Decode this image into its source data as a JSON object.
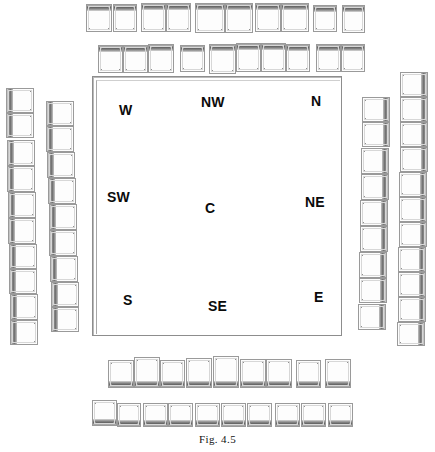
{
  "figure": {
    "caption": "Fig. 4.5",
    "plaza": {
      "name": "central-plaza",
      "labels": [
        {
          "id": "W",
          "text": "W",
          "x": 26,
          "y": 26
        },
        {
          "id": "NW",
          "text": "NW",
          "x": 108,
          "y": 18
        },
        {
          "id": "N",
          "text": "N",
          "x": 218,
          "y": 17
        },
        {
          "id": "SW",
          "text": "SW",
          "x": 14,
          "y": 113
        },
        {
          "id": "C",
          "text": "C",
          "x": 112,
          "y": 124
        },
        {
          "id": "NE",
          "text": "NE",
          "x": 212,
          "y": 118
        },
        {
          "id": "S",
          "text": "S",
          "x": 30,
          "y": 216
        },
        {
          "id": "SE",
          "text": "SE",
          "x": 115,
          "y": 222
        },
        {
          "id": "E",
          "text": "E",
          "x": 221,
          "y": 213
        }
      ]
    },
    "groups": [
      {
        "id": "top-outer-row",
        "name": "structure-row-top-outer",
        "orientation": "horizontal",
        "band": "b-top",
        "cells": [
          {
            "x": 86,
            "y": 4,
            "w": 26,
            "h": 28
          },
          {
            "x": 113,
            "y": 4,
            "w": 24,
            "h": 28
          },
          {
            "x": 141,
            "y": 3,
            "w": 25,
            "h": 29
          },
          {
            "x": 166,
            "y": 3,
            "w": 25,
            "h": 29
          },
          {
            "x": 195,
            "y": 3,
            "w": 30,
            "h": 30
          },
          {
            "x": 225,
            "y": 3,
            "w": 28,
            "h": 30
          },
          {
            "x": 255,
            "y": 3,
            "w": 26,
            "h": 29
          },
          {
            "x": 281,
            "y": 3,
            "w": 28,
            "h": 29
          },
          {
            "x": 313,
            "y": 5,
            "w": 24,
            "h": 27
          },
          {
            "x": 342,
            "y": 5,
            "w": 23,
            "h": 28
          }
        ]
      },
      {
        "id": "top-inner-row",
        "name": "structure-row-top-inner",
        "orientation": "horizontal",
        "band": "b-top",
        "cells": [
          {
            "x": 98,
            "y": 45,
            "w": 25,
            "h": 28
          },
          {
            "x": 123,
            "y": 45,
            "w": 25,
            "h": 28
          },
          {
            "x": 148,
            "y": 44,
            "w": 26,
            "h": 29
          },
          {
            "x": 180,
            "y": 45,
            "w": 25,
            "h": 27
          },
          {
            "x": 209,
            "y": 44,
            "w": 27,
            "h": 30
          },
          {
            "x": 236,
            "y": 43,
            "w": 25,
            "h": 29
          },
          {
            "x": 261,
            "y": 43,
            "w": 25,
            "h": 29
          },
          {
            "x": 286,
            "y": 44,
            "w": 24,
            "h": 28
          },
          {
            "x": 316,
            "y": 44,
            "w": 25,
            "h": 28
          },
          {
            "x": 341,
            "y": 44,
            "w": 24,
            "h": 28
          }
        ]
      },
      {
        "id": "left-outer-col",
        "name": "structure-column-left-outer",
        "orientation": "vertical",
        "band": "b-left",
        "cells": [
          {
            "x": 6,
            "y": 88,
            "w": 28,
            "h": 25
          },
          {
            "x": 6,
            "y": 113,
            "w": 28,
            "h": 25
          },
          {
            "x": 7,
            "y": 140,
            "w": 28,
            "h": 26
          },
          {
            "x": 7,
            "y": 166,
            "w": 28,
            "h": 26
          },
          {
            "x": 8,
            "y": 192,
            "w": 28,
            "h": 26
          },
          {
            "x": 8,
            "y": 218,
            "w": 28,
            "h": 26
          },
          {
            "x": 9,
            "y": 244,
            "w": 28,
            "h": 25
          },
          {
            "x": 9,
            "y": 269,
            "w": 28,
            "h": 25
          },
          {
            "x": 10,
            "y": 294,
            "w": 28,
            "h": 26
          },
          {
            "x": 10,
            "y": 320,
            "w": 28,
            "h": 25
          }
        ]
      },
      {
        "id": "left-inner-col",
        "name": "structure-column-left-inner",
        "orientation": "vertical",
        "band": "b-left",
        "cells": [
          {
            "x": 46,
            "y": 101,
            "w": 28,
            "h": 25
          },
          {
            "x": 46,
            "y": 126,
            "w": 28,
            "h": 26
          },
          {
            "x": 47,
            "y": 152,
            "w": 28,
            "h": 26
          },
          {
            "x": 48,
            "y": 178,
            "w": 28,
            "h": 26
          },
          {
            "x": 49,
            "y": 204,
            "w": 28,
            "h": 26
          },
          {
            "x": 49,
            "y": 230,
            "w": 28,
            "h": 26
          },
          {
            "x": 50,
            "y": 256,
            "w": 28,
            "h": 26
          },
          {
            "x": 51,
            "y": 282,
            "w": 28,
            "h": 25
          },
          {
            "x": 51,
            "y": 307,
            "w": 28,
            "h": 25
          }
        ]
      },
      {
        "id": "right-inner-col",
        "name": "structure-column-right-inner",
        "orientation": "vertical",
        "band": "b-right",
        "cells": [
          {
            "x": 362,
            "y": 97,
            "w": 28,
            "h": 25
          },
          {
            "x": 362,
            "y": 122,
            "w": 28,
            "h": 25
          },
          {
            "x": 361,
            "y": 148,
            "w": 28,
            "h": 26
          },
          {
            "x": 361,
            "y": 174,
            "w": 28,
            "h": 26
          },
          {
            "x": 360,
            "y": 200,
            "w": 28,
            "h": 26
          },
          {
            "x": 360,
            "y": 226,
            "w": 28,
            "h": 26
          },
          {
            "x": 359,
            "y": 252,
            "w": 28,
            "h": 26
          },
          {
            "x": 359,
            "y": 278,
            "w": 28,
            "h": 25
          },
          {
            "x": 358,
            "y": 304,
            "w": 28,
            "h": 26
          }
        ]
      },
      {
        "id": "right-outer-col",
        "name": "structure-column-right-outer",
        "orientation": "vertical",
        "band": "b-right",
        "cells": [
          {
            "x": 400,
            "y": 72,
            "w": 28,
            "h": 25
          },
          {
            "x": 400,
            "y": 97,
            "w": 28,
            "h": 25
          },
          {
            "x": 400,
            "y": 122,
            "w": 28,
            "h": 25
          },
          {
            "x": 400,
            "y": 147,
            "w": 28,
            "h": 25
          },
          {
            "x": 399,
            "y": 172,
            "w": 28,
            "h": 25
          },
          {
            "x": 399,
            "y": 197,
            "w": 28,
            "h": 25
          },
          {
            "x": 399,
            "y": 222,
            "w": 28,
            "h": 25
          },
          {
            "x": 398,
            "y": 247,
            "w": 28,
            "h": 25
          },
          {
            "x": 398,
            "y": 272,
            "w": 28,
            "h": 25
          },
          {
            "x": 398,
            "y": 297,
            "w": 28,
            "h": 25
          },
          {
            "x": 397,
            "y": 322,
            "w": 28,
            "h": 24
          }
        ]
      },
      {
        "id": "bottom-inner-row",
        "name": "structure-row-bottom-inner",
        "orientation": "horizontal",
        "band": "b-bottom",
        "cells": [
          {
            "x": 108,
            "y": 360,
            "w": 26,
            "h": 28
          },
          {
            "x": 134,
            "y": 357,
            "w": 26,
            "h": 31
          },
          {
            "x": 160,
            "y": 360,
            "w": 25,
            "h": 28
          },
          {
            "x": 186,
            "y": 358,
            "w": 26,
            "h": 30
          },
          {
            "x": 213,
            "y": 356,
            "w": 26,
            "h": 32
          },
          {
            "x": 240,
            "y": 359,
            "w": 26,
            "h": 29
          },
          {
            "x": 266,
            "y": 359,
            "w": 26,
            "h": 29
          },
          {
            "x": 296,
            "y": 360,
            "w": 25,
            "h": 28
          },
          {
            "x": 325,
            "y": 359,
            "w": 26,
            "h": 29
          },
          {
            "x": 323,
            "y": 359,
            "w": 0,
            "h": 0
          }
        ]
      },
      {
        "id": "bottom-outer-row",
        "name": "structure-row-bottom-outer",
        "orientation": "horizontal",
        "band": "b-bottom",
        "cells": [
          {
            "x": 92,
            "y": 400,
            "w": 25,
            "h": 26
          },
          {
            "x": 117,
            "y": 403,
            "w": 24,
            "h": 24
          },
          {
            "x": 143,
            "y": 403,
            "w": 25,
            "h": 24
          },
          {
            "x": 168,
            "y": 403,
            "w": 25,
            "h": 24
          },
          {
            "x": 195,
            "y": 403,
            "w": 25,
            "h": 24
          },
          {
            "x": 221,
            "y": 403,
            "w": 25,
            "h": 24
          },
          {
            "x": 247,
            "y": 403,
            "w": 25,
            "h": 24
          },
          {
            "x": 275,
            "y": 403,
            "w": 25,
            "h": 24
          },
          {
            "x": 301,
            "y": 403,
            "w": 25,
            "h": 24
          },
          {
            "x": 328,
            "y": 403,
            "w": 25,
            "h": 24
          }
        ]
      }
    ]
  }
}
